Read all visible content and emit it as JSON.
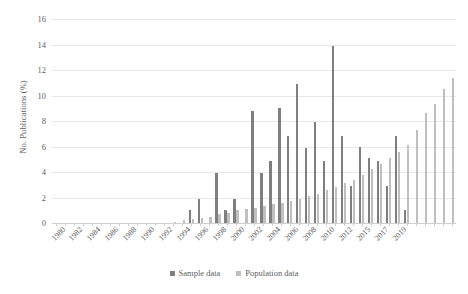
{
  "chart_data": {
    "type": "bar",
    "title": "",
    "xlabel": "",
    "ylabel": "No. Publications (%)",
    "ylim": [
      0,
      16
    ],
    "ytick_step": 2,
    "yticks": [
      0,
      2,
      4,
      6,
      8,
      10,
      12,
      14,
      16
    ],
    "grid": true,
    "legend_position": "bottom",
    "colors": {
      "sample": "#7f7f7f",
      "population": "#bfbfbf",
      "gridline": "#e8e8e8",
      "axis": "#cfcfcf",
      "text": "#5e5e5e",
      "background": "#ffffff"
    },
    "categories": [
      "1980",
      "1981",
      "1982",
      "1983",
      "1984",
      "1985",
      "1986",
      "1987",
      "1988",
      "1989",
      "1990",
      "1991",
      "1992",
      "1993",
      "1994",
      "1995",
      "1996",
      "1997",
      "1998",
      "1999",
      "2000",
      "2001",
      "2002",
      "2003",
      "2004",
      "2005",
      "2006",
      "2007",
      "2008",
      "2009",
      "2010",
      "2011",
      "2012",
      "2013",
      "2014",
      "2015",
      "2016",
      "2017",
      "2018",
      "2019"
    ],
    "tick_labels": [
      "1980",
      "",
      "1982",
      "",
      "1984",
      "",
      "1986",
      "",
      "1988",
      "",
      "1990",
      "",
      "1992",
      "",
      "1994",
      "",
      "1996",
      "",
      "1998",
      "",
      "2000",
      "",
      "2002",
      "",
      "2004",
      "",
      "2006",
      "",
      "2008",
      "",
      "2010",
      "",
      "2012",
      "",
      "",
      "2015",
      "",
      "2017",
      "",
      "2019"
    ],
    "series": [
      {
        "name": "Sample data",
        "color": "#7f7f7f",
        "values": [
          0,
          0,
          0,
          0,
          0,
          0,
          0,
          0,
          0,
          0,
          0,
          0,
          0,
          0,
          0.4,
          0,
          1.9,
          0,
          3.9,
          0,
          1.9,
          0,
          3.9,
          0,
          6.8,
          0,
          7.8,
          0,
          13.9,
          0,
          5.1,
          0,
          2.9,
          0,
          0,
          0,
          0,
          0,
          0,
          0
        ]
      },
      {
        "name": "Population data",
        "color": "#bfbfbf",
        "values": [
          0,
          0,
          0,
          0,
          0,
          0,
          0,
          0,
          0,
          0,
          0,
          0,
          0,
          0,
          0.2,
          0.3,
          0.4,
          0.8,
          1.0,
          1.1,
          1.3,
          1.5,
          1.6,
          1.9,
          2.0,
          2.2,
          2.4,
          2.7,
          3.3,
          3.6,
          4.2,
          4.6,
          5.1,
          5.5,
          6.0,
          7.3,
          8.3,
          9.3,
          10.5,
          11.4
        ]
      }
    ],
    "bar_pairs": [
      {
        "year": "1980",
        "sample": 0,
        "population": 0
      },
      {
        "year": "1981",
        "sample": 0,
        "population": 0
      },
      {
        "year": "1982",
        "sample": 0,
        "population": 0
      },
      {
        "year": "1983",
        "sample": 0,
        "population": 0
      },
      {
        "year": "1984",
        "sample": 0,
        "population": 0
      },
      {
        "year": "1985",
        "sample": 0,
        "population": 0
      },
      {
        "year": "1986",
        "sample": 0,
        "population": 0
      },
      {
        "year": "1987",
        "sample": 0,
        "population": 0
      },
      {
        "year": "1988",
        "sample": 0,
        "population": 0
      },
      {
        "year": "1989",
        "sample": 0,
        "population": 0
      },
      {
        "year": "1990",
        "sample": 0,
        "population": 0
      },
      {
        "year": "1991",
        "sample": 0,
        "population": 0
      },
      {
        "year": "1992",
        "sample": 0,
        "population": 0
      },
      {
        "year": "1993",
        "sample": 0,
        "population": 0.1
      },
      {
        "year": "1994",
        "sample": 0,
        "population": 0.2
      },
      {
        "year": "1995",
        "sample": 1.0,
        "population": 0.3
      },
      {
        "year": "1996",
        "sample": 1.9,
        "population": 0.4
      },
      {
        "year": "1997",
        "sample": 0,
        "population": 0.5
      },
      {
        "year": "1998",
        "sample": 3.9,
        "population": 0.7
      },
      {
        "year": "1999",
        "sample": 1.0,
        "population": 0.8
      },
      {
        "year": "2000",
        "sample": 1.9,
        "population": 1.0
      },
      {
        "year": "2001",
        "sample": 0,
        "population": 1.1
      },
      {
        "year": "2002",
        "sample": 8.8,
        "population": 1.2
      },
      {
        "year": "2003",
        "sample": 3.9,
        "population": 1.3
      },
      {
        "year": "2004",
        "sample": 4.9,
        "population": 1.5
      },
      {
        "year": "2005",
        "sample": 9.0,
        "population": 1.6
      },
      {
        "year": "2006",
        "sample": 6.8,
        "population": 1.7
      },
      {
        "year": "2007",
        "sample": 10.9,
        "population": 1.9
      },
      {
        "year": "2008",
        "sample": 5.9,
        "population": 2.1
      },
      {
        "year": "2009",
        "sample": 7.9,
        "population": 2.3
      },
      {
        "year": "2010",
        "sample": 4.9,
        "population": 2.6
      },
      {
        "year": "2011",
        "sample": 13.9,
        "population": 2.8
      },
      {
        "year": "2012",
        "sample": 6.8,
        "population": 3.1
      },
      {
        "year": "2013",
        "sample": 2.9,
        "population": 3.4
      },
      {
        "year": "2014",
        "sample": 6.0,
        "population": 3.8
      },
      {
        "year": "2015",
        "sample": 5.1,
        "population": 4.2
      },
      {
        "year": "2016",
        "sample": 4.9,
        "population": 4.6
      },
      {
        "year": "2017",
        "sample": 2.9,
        "population": 5.1
      },
      {
        "year": "2018",
        "sample": 6.8,
        "population": 5.6
      },
      {
        "year": "2019",
        "sample": 1.0,
        "population": 6.1
      },
      {
        "year": "2020",
        "sample": 0,
        "population": 7.3
      },
      {
        "year": "2021",
        "sample": 0,
        "population": 8.6
      },
      {
        "year": "2022",
        "sample": 0,
        "population": 9.3
      },
      {
        "year": "2023",
        "sample": 0,
        "population": 10.5
      },
      {
        "year": "2024",
        "sample": 0,
        "population": 11.4
      }
    ]
  },
  "legend": {
    "items": [
      {
        "label": "Sample data",
        "color": "#7f7f7f"
      },
      {
        "label": "Population data",
        "color": "#bfbfbf"
      }
    ]
  },
  "axis": {
    "y_title": "No. Publications (%)"
  },
  "x_tick_labels": [
    "1980",
    "1982",
    "1984",
    "1986",
    "1988",
    "1990",
    "1992",
    "1994",
    "1996",
    "1998",
    "2000",
    "2002",
    "2004",
    "2006",
    "2008",
    "2010",
    "2012",
    "2015",
    "2017",
    "2019"
  ]
}
